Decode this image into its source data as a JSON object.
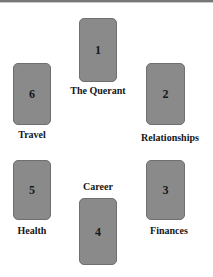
{
  "diagram": {
    "background_color": "#ffffff",
    "card_fill_color": "#8a8a8a",
    "card_border_color": "#6f6f6f",
    "text_color": "#141618"
  },
  "cards": [
    {
      "number": "1",
      "label": "The Querant",
      "label_position": "below",
      "position": "top-center"
    },
    {
      "number": "2",
      "label": "Relationships",
      "label_position": "below",
      "position": "upper-right"
    },
    {
      "number": "3",
      "label": "Finances",
      "label_position": "below",
      "position": "lower-right"
    },
    {
      "number": "4",
      "label": "Career",
      "label_position": "above",
      "position": "bottom-center"
    },
    {
      "number": "5",
      "label": "Health",
      "label_position": "below",
      "position": "lower-left"
    },
    {
      "number": "6",
      "label": "Travel",
      "label_position": "below",
      "position": "upper-left"
    }
  ]
}
